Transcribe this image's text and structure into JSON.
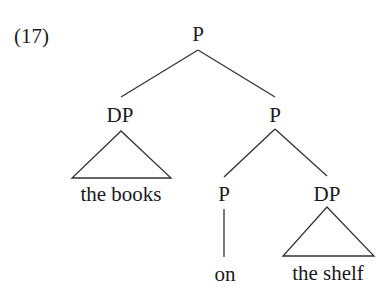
{
  "example": {
    "number": "(17)"
  },
  "tree": {
    "root": {
      "label": "P"
    },
    "left": {
      "label": "DP",
      "terminal": "the books",
      "terminal_type": "triangle"
    },
    "right": {
      "label": "P",
      "left": {
        "label": "P",
        "terminal": "on",
        "terminal_type": "line"
      },
      "right": {
        "label": "DP",
        "terminal": "the shelf",
        "terminal_type": "triangle"
      }
    }
  },
  "colors": {
    "text": "#1a1a1a",
    "lines": "#333333",
    "background": "#ffffff"
  }
}
